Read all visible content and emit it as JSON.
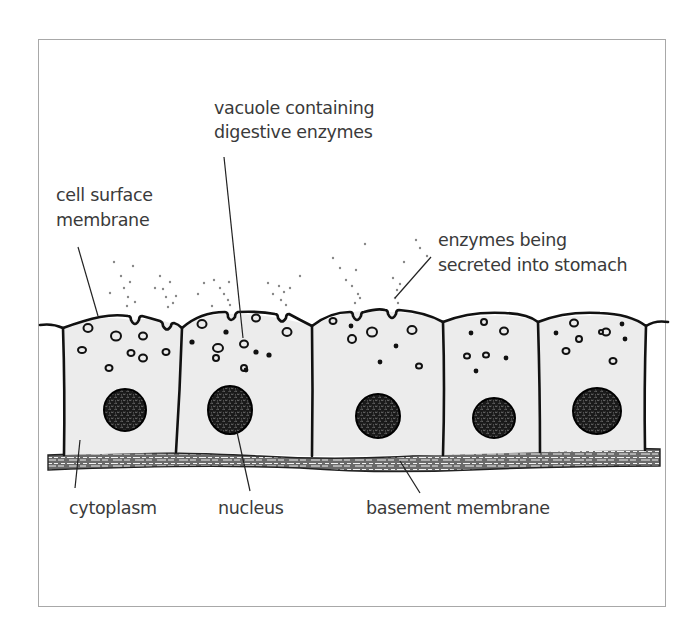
{
  "diagram": {
    "colors": {
      "frame_border": "#a8a8a8",
      "label_text": "#3a3a3a",
      "cell_outline": "#111111",
      "cytoplasm_fill": "#ececec",
      "nucleus_fill": "#1a1a1a",
      "basement_membrane": "#555555"
    },
    "labels": {
      "vacuole_line1": "vacuole containing",
      "vacuole_line2": "digestive enzymes",
      "cell_surface_line1": "cell surface",
      "cell_surface_line2": "membrane",
      "enzymes_line1": "enzymes being",
      "enzymes_line2": "secreted into stomach",
      "cytoplasm": "cytoplasm",
      "nucleus": "nucleus",
      "basement_membrane": "basement membrane"
    },
    "cells": [
      {
        "name": "cell-1",
        "x0": 62,
        "x1": 182,
        "nucleus": {
          "cx": 125,
          "cy": 410,
          "r": 21
        }
      },
      {
        "name": "cell-2",
        "x0": 182,
        "x1": 312,
        "nucleus": {
          "cx": 230,
          "cy": 410,
          "r": 23
        }
      },
      {
        "name": "cell-3",
        "x0": 312,
        "x1": 443,
        "nucleus": {
          "cx": 378,
          "cy": 416,
          "r": 22
        }
      },
      {
        "name": "cell-4",
        "x0": 443,
        "x1": 538,
        "nucleus": {
          "cx": 494,
          "cy": 418,
          "r": 21
        }
      },
      {
        "name": "cell-5",
        "x0": 538,
        "x1": 648,
        "nucleus": {
          "cx": 597,
          "cy": 411,
          "r": 24
        }
      }
    ]
  }
}
